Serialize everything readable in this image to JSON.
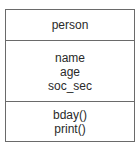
{
  "class": {
    "name": "person",
    "attributes": [
      "name",
      "age",
      "soc_sec"
    ],
    "operations": [
      "bday()",
      "print()"
    ]
  }
}
